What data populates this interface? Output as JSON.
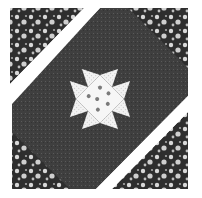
{
  "image": {
    "subject": "quilt-block",
    "description": "Sawtooth star (eight-pointed star) quilt block set on point with floral corner triangles",
    "colors": {
      "background": "#ffffff",
      "dark_print": "#3a3a3a",
      "floral_dark": "#2e2e2e",
      "floral_light": "#d8d8d8",
      "light_dotted": "#eeeeee",
      "center_dots": "#7a7a7a"
    }
  }
}
